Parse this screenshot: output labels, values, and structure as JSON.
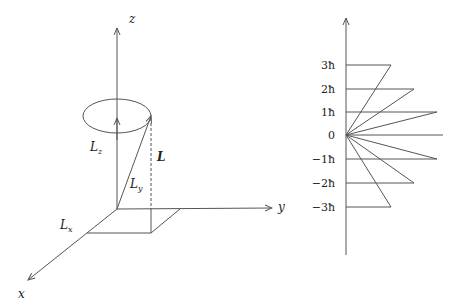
{
  "left_diagram": {
    "axes": {
      "x": "x",
      "y": "y",
      "z": "z"
    },
    "labels": {
      "Lz": "L",
      "Lz_sub": "z",
      "Ly": "L",
      "Ly_sub": "y",
      "Lx": "L",
      "Lx_sub": "x",
      "L": "L"
    }
  },
  "right_diagram": {
    "levels": [
      {
        "label": "3ħ",
        "m": 3
      },
      {
        "label": "2ħ",
        "m": 2
      },
      {
        "label": "1ħ",
        "m": 1
      },
      {
        "label": "0",
        "m": 0
      },
      {
        "label": "−1ħ",
        "m": -1
      },
      {
        "label": "−2ħ",
        "m": -2
      },
      {
        "label": "−3ħ",
        "m": -3
      }
    ]
  },
  "colors": {
    "line": "#555555",
    "text": "#222222",
    "background": "#ffffff"
  }
}
